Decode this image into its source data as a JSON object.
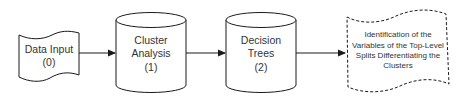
{
  "diagram": {
    "type": "flowchart",
    "direction": "left-to-right",
    "colors": {
      "stroke": "#1a1a1a",
      "fill": "#ffffff",
      "text": "#333333",
      "arrow": "#1a1a1a"
    },
    "nodes": [
      {
        "id": "data-input",
        "shape": "tape",
        "border": "solid",
        "lines": [
          "Data Input",
          "(0)"
        ]
      },
      {
        "id": "cluster-analysis",
        "shape": "cylinder",
        "border": "solid",
        "lines": [
          "Cluster",
          "Analysis",
          "(1)"
        ]
      },
      {
        "id": "decision-trees",
        "shape": "cylinder",
        "border": "solid",
        "lines": [
          "Decision",
          "Trees",
          "(2)"
        ]
      },
      {
        "id": "identification",
        "shape": "tape",
        "border": "dashed",
        "lines": [
          "Identification of the",
          "Variables of the Top-Level",
          "Splits Differentiating the",
          "Clusters"
        ]
      }
    ],
    "edges": [
      {
        "from": "data-input",
        "to": "cluster-analysis"
      },
      {
        "from": "cluster-analysis",
        "to": "decision-trees"
      },
      {
        "from": "decision-trees",
        "to": "identification"
      }
    ]
  }
}
